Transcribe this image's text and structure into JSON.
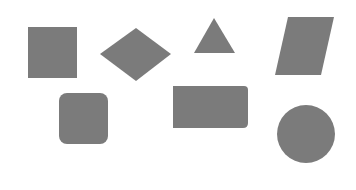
{
  "canvas": {
    "width": 356,
    "height": 190,
    "background": "#ffffff"
  },
  "fill": "#7b7b7b",
  "shapes": [
    {
      "name": "square",
      "type": "rect",
      "x": 28,
      "y": 27,
      "w": 49,
      "h": 51,
      "rx": 0
    },
    {
      "name": "diamond",
      "type": "polygon",
      "points": "100,54 136,28 171,54 136,81"
    },
    {
      "name": "triangle",
      "type": "polygon",
      "points": "214,18 235,53 194,53"
    },
    {
      "name": "parallelogram",
      "type": "polygon",
      "points": "288,17 334,17 321,75 275,75"
    },
    {
      "name": "rounded-square",
      "type": "rect",
      "x": 59,
      "y": 93,
      "w": 49,
      "h": 51,
      "rx": 8
    },
    {
      "name": "rectangle",
      "type": "path",
      "d": "M173,86 H244 Q248,86 248,90 V123 Q248,128 243,128 H173 Z"
    },
    {
      "name": "circle",
      "type": "circle",
      "cx": 306,
      "cy": 134,
      "r": 29
    }
  ]
}
